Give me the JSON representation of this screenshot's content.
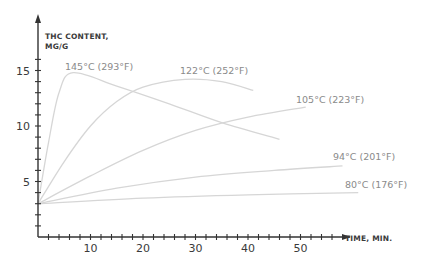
{
  "chart_data": {
    "type": "line",
    "title": "",
    "xlabel": "TIME, MIN.",
    "ylabel_lines": [
      "THC CONTENT,",
      "MG/G"
    ],
    "xlim": [
      0,
      60
    ],
    "ylim": [
      0,
      17
    ],
    "x_ticks": [
      10,
      20,
      30,
      40,
      50
    ],
    "y_ticks": [
      5,
      10,
      15
    ],
    "grid": false,
    "legend": "inline labels at curve ends",
    "series": [
      {
        "name": "145°C (293°F)",
        "points": [
          [
            0,
            3.0
          ],
          [
            2,
            8.5
          ],
          [
            4,
            13.0
          ],
          [
            6.7,
            14.8
          ],
          [
            15,
            13.6
          ],
          [
            25,
            12.0
          ],
          [
            35,
            10.3
          ],
          [
            46,
            8.8
          ]
        ]
      },
      {
        "name": "122°C (252°F)",
        "points": [
          [
            0,
            3.0
          ],
          [
            5,
            6.8
          ],
          [
            10,
            10.0
          ],
          [
            15,
            12.2
          ],
          [
            20,
            13.5
          ],
          [
            28,
            14.2
          ],
          [
            35,
            14.0
          ],
          [
            41,
            13.2
          ]
        ]
      },
      {
        "name": "105°C (223°F)",
        "points": [
          [
            0,
            3.0
          ],
          [
            10,
            5.5
          ],
          [
            20,
            7.8
          ],
          [
            30,
            9.6
          ],
          [
            40,
            10.8
          ],
          [
            51,
            11.7
          ]
        ]
      },
      {
        "name": "94°C (201°F)",
        "points": [
          [
            0,
            3.0
          ],
          [
            15,
            4.4
          ],
          [
            30,
            5.4
          ],
          [
            45,
            6.0
          ],
          [
            58,
            6.4
          ]
        ]
      },
      {
        "name": "80°C (176°F)",
        "points": [
          [
            0,
            3.0
          ],
          [
            20,
            3.5
          ],
          [
            40,
            3.8
          ],
          [
            61,
            4.0
          ]
        ]
      }
    ]
  }
}
